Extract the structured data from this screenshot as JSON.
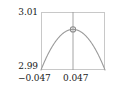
{
  "chart_data": {
    "type": "line",
    "title": "",
    "xlabel": "",
    "ylabel": "",
    "xlim": [
      -0.047,
      0.047
    ],
    "ylim": [
      2.99,
      3.01
    ],
    "grid": false,
    "legend": null,
    "x_ticks": [
      "−0.047",
      "0.047"
    ],
    "x_tick_values": [
      -0.047,
      0.047
    ],
    "y_ticks": [
      "3.01",
      "2.99"
    ],
    "y_tick_values": [
      3.01,
      2.99
    ],
    "series": [
      {
        "name": "curve",
        "style": "parabola",
        "color": "#9a9a9a",
        "x": [
          -0.047,
          -0.0423,
          -0.0376,
          -0.0329,
          -0.0282,
          -0.0235,
          -0.0188,
          -0.0141,
          -0.0094,
          -0.0047,
          0.0,
          0.0047,
          0.0094,
          0.0141,
          0.0188,
          0.0235,
          0.0282,
          0.0329,
          0.0376,
          0.0423,
          0.047
        ],
        "y": [
          2.99,
          2.9914,
          2.99264,
          2.99371,
          2.99462,
          2.99535,
          2.99593,
          2.99635,
          2.9966,
          2.99669,
          3.004,
          2.99669,
          2.9966,
          2.99635,
          2.99593,
          2.99535,
          2.99462,
          2.99371,
          2.99264,
          2.9914,
          2.99
        ]
      }
    ],
    "markers": [
      {
        "name": "apex-marker",
        "shape": "open-circle",
        "x": 0.0,
        "y": 3.004,
        "color": "#8c8c8c"
      }
    ],
    "reference_lines": [
      {
        "name": "vertical-center-line",
        "orientation": "vertical",
        "x": 0.0,
        "color": "#9a9a9a"
      }
    ]
  },
  "axes": {
    "y_top_label": "3.01",
    "y_bottom_label": "2.99",
    "x_left_label": "−0.047",
    "x_right_label": "0.047"
  },
  "colors": {
    "frame": "#c8c8c8",
    "curve": "#9a9a9a",
    "marker": "#8c8c8c",
    "text": "#1a1a1a",
    "background": "#ffffff"
  }
}
